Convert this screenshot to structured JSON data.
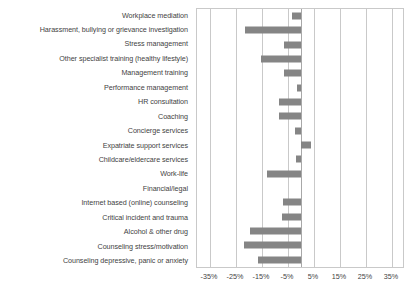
{
  "chart_data": {
    "type": "bar",
    "orientation": "horizontal",
    "title": "",
    "xlabel": "",
    "ylabel": "",
    "xlim": [
      -40,
      40
    ],
    "ticks": [
      "-35%",
      "-25%",
      "-15%",
      "-5%",
      "5%",
      "15%",
      "25%",
      "35%"
    ],
    "tick_values": [
      -35,
      -25,
      -15,
      -5,
      5,
      15,
      25,
      35
    ],
    "grid": true,
    "legend": "none",
    "bar_color": "#858585",
    "grid_color": "#c9c9c9",
    "categories": [
      "Workplace mediation",
      "Harassment, bullying or grievance investigation",
      "Stress management",
      "Other specialist training (healthy lifestyle)",
      "Management training",
      "Performance management",
      "HR consultation",
      "Coaching",
      "Concierge services",
      "Expatriate support services",
      "Childcare/eldercare services",
      "Work-life",
      "Financial/legal",
      "Internet based (online) counseling",
      "Critical incident and trauma",
      "Alcohol & other drug",
      "Counseling stress/motivation",
      "Counseling depressive, panic or anxiety"
    ],
    "values": [
      -3.5,
      -21.5,
      -6.5,
      -15.5,
      -6.5,
      -1.5,
      -8.5,
      -8.5,
      -2.5,
      4.0,
      -2.0,
      -13.0,
      0.0,
      -7.0,
      -7.5,
      -19.5,
      -22.0,
      -16.5
    ]
  }
}
